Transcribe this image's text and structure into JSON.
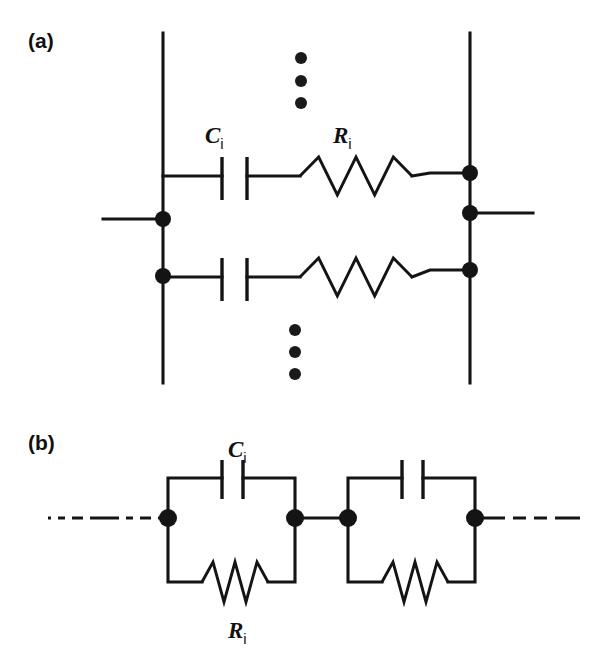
{
  "figure": {
    "background_color": "#ffffff",
    "ink_color": "#141414"
  },
  "panels": [
    {
      "id": "a",
      "label": "(a)",
      "label_x": 28,
      "label_y": 48,
      "description": "Parallel stack of series RC branches between two vertical bus rails",
      "components": [
        {
          "kind": "capacitor",
          "label_main": "C",
          "label_sub": "i",
          "label_x": 205,
          "label_y": 143
        },
        {
          "kind": "resistor",
          "label_main": "R",
          "label_sub": "i",
          "label_x": 333,
          "label_y": 143
        }
      ],
      "ellipsis_groups": [
        {
          "name": "upper-ellipsis",
          "x": 301,
          "ys": [
            58,
            81,
            103
          ],
          "radius": 6
        },
        {
          "name": "lower-ellipsis",
          "x": 295,
          "ys": [
            330,
            352,
            374
          ],
          "radius": 6
        }
      ],
      "rails": [
        {
          "name": "left-rail",
          "x": 163,
          "y1": 33,
          "y2": 383
        },
        {
          "name": "right-rail",
          "x": 470,
          "y1": 33,
          "y2": 383
        }
      ],
      "terminal_leads": [
        {
          "name": "left-terminal-lead",
          "x1": 103,
          "y1": 219,
          "x2": 163,
          "y2": 219
        },
        {
          "name": "right-terminal-lead",
          "x1": 470,
          "y1": 213,
          "x2": 533,
          "y2": 213
        }
      ],
      "nodes": [
        {
          "name": "left-node-upper",
          "x": 163,
          "y": 219,
          "radius": 8
        },
        {
          "name": "left-node-lower",
          "x": 163,
          "y": 276,
          "radius": 8
        },
        {
          "name": "right-node-top",
          "x": 470,
          "y": 173,
          "radius": 8
        },
        {
          "name": "right-node-mid",
          "x": 470,
          "y": 213,
          "radius": 8
        },
        {
          "name": "right-node-lower",
          "x": 470,
          "y": 270,
          "radius": 8
        }
      ],
      "branches": [
        {
          "name": "branch-upper",
          "y": 176,
          "wire_in": {
            "x1": 163,
            "x2": 222
          },
          "capacitor": {
            "plate1_x": 222,
            "plate2_x": 247,
            "plate_top": 157,
            "plate_bottom": 200
          },
          "wire_mid": {
            "x1": 247,
            "x2": 300
          },
          "resistor": {
            "x_start": 300,
            "x_end": 412,
            "peaks": 3,
            "amplitude": 19
          },
          "wire_out": {
            "x1": 412,
            "x2": 470,
            "y_out": 173
          }
        },
        {
          "name": "branch-lower",
          "y": 277,
          "wire_in": {
            "x1": 163,
            "x2": 222
          },
          "capacitor": {
            "plate1_x": 222,
            "plate2_x": 247,
            "plate_top": 258,
            "plate_bottom": 301
          },
          "wire_mid": {
            "x1": 247,
            "x2": 300
          },
          "resistor": {
            "x_start": 300,
            "x_end": 412,
            "peaks": 3,
            "amplitude": 19
          },
          "wire_out": {
            "x1": 412,
            "x2": 470,
            "y_out": 270
          }
        }
      ]
    },
    {
      "id": "b",
      "label": "(b)",
      "label_x": 28,
      "label_y": 450,
      "description": "Chain of two parallel RC cells in series with dashed continuation leads",
      "components": [
        {
          "kind": "capacitor",
          "label_main": "C",
          "label_sub": "i",
          "label_x": 228,
          "label_y": 457
        },
        {
          "kind": "resistor",
          "label_main": "R",
          "label_sub": "i",
          "label_x": 228,
          "label_y": 638
        }
      ],
      "spine_y": 518,
      "dashed_leads": [
        {
          "name": "left-dashed-lead",
          "x1": 48,
          "x2": 168,
          "y": 518,
          "dash_pattern": "3,7,7,7,11,7,26,0"
        },
        {
          "name": "right-dashed-lead",
          "x1": 475,
          "x2": 580,
          "y": 518,
          "dash_pattern": "30,8,13,8,13,8,4,0"
        }
      ],
      "cells": [
        {
          "name": "rc-cell-1",
          "left_x": 168,
          "right_x": 295,
          "top_y": 478,
          "bottom_y": 582,
          "capacitor": {
            "plate1_x": 222,
            "plate2_x": 243,
            "plate_top": 460,
            "plate_bottom": 499
          },
          "resistor": {
            "x_start": 202,
            "x_end": 268,
            "peaks": 3,
            "amplitude": 20,
            "y": 582
          }
        },
        {
          "name": "rc-cell-2",
          "left_x": 348,
          "right_x": 475,
          "top_y": 478,
          "bottom_y": 582,
          "capacitor": {
            "plate1_x": 402,
            "plate2_x": 423,
            "plate_top": 460,
            "plate_bottom": 499
          },
          "resistor": {
            "x_start": 382,
            "x_end": 448,
            "peaks": 3,
            "amplitude": 20,
            "y": 582
          }
        }
      ],
      "connector": {
        "name": "cell-connector",
        "x1": 295,
        "x2": 348,
        "y": 518
      },
      "nodes": [
        {
          "name": "node-b-1",
          "x": 168,
          "y": 518,
          "radius": 9
        },
        {
          "name": "node-b-2",
          "x": 295,
          "y": 518,
          "radius": 9
        },
        {
          "name": "node-b-3",
          "x": 348,
          "y": 518,
          "radius": 9
        },
        {
          "name": "node-b-4",
          "x": 475,
          "y": 518,
          "radius": 9
        }
      ]
    }
  ]
}
